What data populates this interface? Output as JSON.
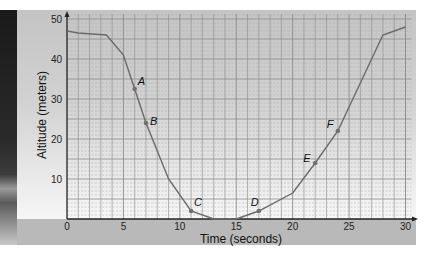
{
  "chart_data": {
    "type": "line",
    "title": "",
    "xlabel": "Time (seconds)",
    "ylabel": "Altitude (meters)",
    "xlim": [
      0,
      30
    ],
    "ylim": [
      0,
      50
    ],
    "x_ticks": [
      0,
      5,
      10,
      15,
      20,
      25,
      30
    ],
    "y_ticks": [
      10,
      20,
      30,
      40,
      50
    ],
    "grid": true,
    "legend": null,
    "series": [
      {
        "name": "Altitude",
        "x": [
          0,
          1,
          3.5,
          5,
          6,
          7,
          9,
          11,
          13,
          15,
          17,
          20,
          22,
          24,
          28,
          30
        ],
        "y": [
          47,
          46.5,
          46,
          41,
          32.5,
          24,
          10,
          2,
          0,
          0,
          2,
          6.5,
          14,
          22,
          46,
          48
        ]
      }
    ],
    "labeled_points": [
      {
        "label": "A",
        "x": 6,
        "y": 32.5
      },
      {
        "label": "B",
        "x": 7,
        "y": 24
      },
      {
        "label": "C",
        "x": 11,
        "y": 2
      },
      {
        "label": "D",
        "x": 17,
        "y": 2
      },
      {
        "label": "E",
        "x": 22,
        "y": 14
      },
      {
        "label": "F",
        "x": 24,
        "y": 22
      }
    ]
  },
  "axes": {
    "xlabel": "Time (seconds)",
    "ylabel": "Altitude (meters)"
  },
  "colors": {
    "line": "#6a6a6a",
    "point": "#707070",
    "grid_major": "#8a8a8a",
    "grid_minor": "#a8a8a8",
    "axis": "#222222",
    "band": "#b9b9b9"
  }
}
